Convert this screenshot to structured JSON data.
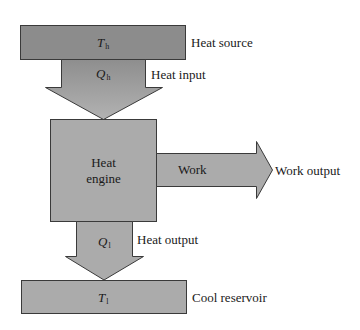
{
  "colors": {
    "heat_source_fill": "#8c8c8c",
    "box_fill": "#ababab",
    "arrow_top": "#8e8e8e",
    "arrow_bottom": "#b2b2b2",
    "stroke": "#3a3a3a"
  },
  "nodes": {
    "heat_source": {
      "symbol": "T",
      "subscript": "h",
      "label": "Heat source"
    },
    "engine": {
      "label_line1": "Heat",
      "label_line2": "engine"
    },
    "cool_reservoir": {
      "symbol": "T",
      "subscript": "l",
      "label": "Cool reservoir"
    }
  },
  "flows": {
    "heat_input": {
      "symbol": "Q",
      "subscript": "h",
      "label": "Heat input"
    },
    "work": {
      "inner_label": "Work",
      "label": "Work output"
    },
    "heat_output": {
      "symbol": "Q",
      "subscript": "l",
      "label": "Heat output"
    }
  }
}
